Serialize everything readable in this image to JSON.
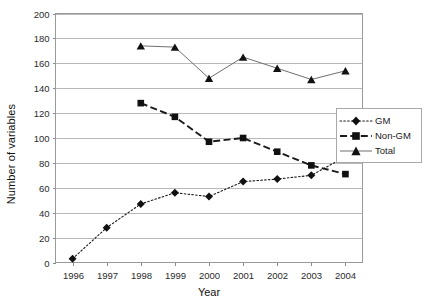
{
  "chart_data": {
    "type": "line",
    "title": "",
    "xlabel": "Year",
    "ylabel": "Number of variables",
    "categories": [
      "1996",
      "1997",
      "1998",
      "1999",
      "2000",
      "2001",
      "2002",
      "2003",
      "2004"
    ],
    "x": [
      1996,
      1997,
      1998,
      1999,
      2000,
      2001,
      2002,
      2003,
      2004
    ],
    "xlim": [
      1995.5,
      2004.5
    ],
    "ylim": [
      0,
      200
    ],
    "ytick_step": 20,
    "yticks": [
      0,
      20,
      40,
      60,
      80,
      100,
      120,
      140,
      160,
      180,
      200
    ],
    "grid": "horizontal",
    "legend_position": "right",
    "series": [
      {
        "name": "GM",
        "marker": "diamond",
        "linestyle": "dotted",
        "color": "#111111",
        "x": [
          1996,
          1997,
          1998,
          1999,
          2000,
          2001,
          2002,
          2003,
          2004
        ],
        "values": [
          3,
          28,
          47,
          56,
          53,
          65,
          67,
          70,
          85
        ]
      },
      {
        "name": "Non-GM",
        "marker": "square",
        "linestyle": "dashed",
        "color": "#111111",
        "x": [
          1998,
          1999,
          2000,
          2001,
          2002,
          2003,
          2004
        ],
        "values": [
          128,
          117,
          97,
          100,
          89,
          78,
          71
        ]
      },
      {
        "name": "Total",
        "marker": "triangle",
        "linestyle": "solid",
        "color": "#6f6f6f",
        "x": [
          1998,
          1999,
          2000,
          2001,
          2002,
          2003,
          2004
        ],
        "values": [
          174,
          173,
          148,
          165,
          156,
          147,
          154
        ]
      }
    ]
  },
  "axes": {
    "y_title": "Number of variables",
    "x_title": "Year"
  },
  "legend": {
    "items": [
      {
        "label": "GM"
      },
      {
        "label": "Non-GM"
      },
      {
        "label": "Total"
      }
    ]
  }
}
